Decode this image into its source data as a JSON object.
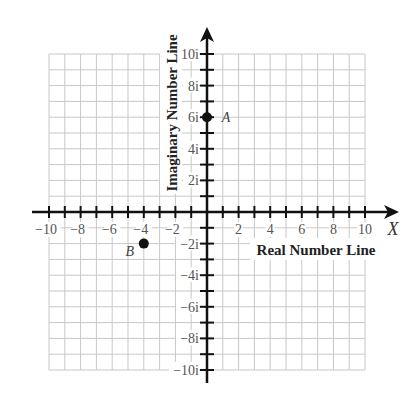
{
  "diagram": {
    "type": "complex-plane",
    "colors": {
      "grid": "#c8c8c8",
      "axis": "#111111",
      "tick_label": "#555555",
      "title": "#222222",
      "point": "#111111"
    },
    "x_axis": {
      "title": "Real Number Line",
      "variable": "X",
      "min": -10,
      "max": 10,
      "tick_step": 1,
      "label_step": 2,
      "tick_labels": [
        "−10",
        "−8",
        "−6",
        "−4",
        "−2",
        "2",
        "4",
        "6",
        "8",
        "10"
      ]
    },
    "y_axis": {
      "title": "Imaginary Number Line",
      "min": -10,
      "max": 10,
      "tick_step": 1,
      "label_step": 2,
      "tick_labels": [
        "10i",
        "8i",
        "6i",
        "4i",
        "2i",
        "−2i",
        "−4i",
        "−6i",
        "−8i",
        "−10i"
      ]
    },
    "points": [
      {
        "name": "A",
        "re": 0,
        "im": 6
      },
      {
        "name": "B",
        "re": -4,
        "im": -2
      }
    ]
  },
  "chart_data": {
    "type": "scatter",
    "title": "",
    "xlabel": "Real Number Line",
    "ylabel": "Imaginary Number Line",
    "xlim": [
      -10,
      10
    ],
    "ylim": [
      -10,
      10
    ],
    "grid": true,
    "x_ticks": [
      -10,
      -8,
      -6,
      -4,
      -2,
      2,
      4,
      6,
      8,
      10
    ],
    "y_ticks": [
      "10i",
      "8i",
      "6i",
      "4i",
      "2i",
      "-2i",
      "-4i",
      "-6i",
      "-8i",
      "-10i"
    ],
    "series": [
      {
        "name": "A",
        "x": [
          0
        ],
        "y": [
          6
        ]
      },
      {
        "name": "B",
        "x": [
          -4
        ],
        "y": [
          -2
        ]
      }
    ]
  }
}
